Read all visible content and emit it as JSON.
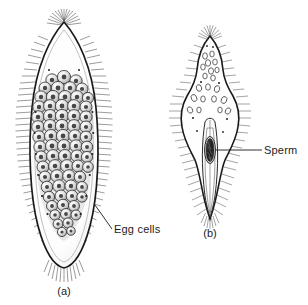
{
  "figure": {
    "background_color": "#ffffff",
    "ink_color": "#1a1a1a",
    "type": "scientific-illustration"
  },
  "labels": {
    "egg_cells": "Egg cells",
    "sperm": "Sperm"
  },
  "captions": {
    "panel_a": "(a)",
    "panel_b": "(b)"
  },
  "panels": [
    {
      "id": "a",
      "caption": "(a)",
      "label": "Egg cells",
      "description": "large ovoid ciliated body with pointed apex, rounded base and a dense central mass of rounded egg cells",
      "cilia": "dense radiating fringe around entire margin",
      "internal_content": "egg cells"
    },
    {
      "id": "b",
      "caption": "(b)",
      "label": "Sperm",
      "description": "slender ciliated body with narrow conical head, bulbous mid region and long tapering tail containing a dark sperm mass",
      "cilia": "dense radiating fringe around entire margin",
      "internal_content": "sperm"
    }
  ]
}
